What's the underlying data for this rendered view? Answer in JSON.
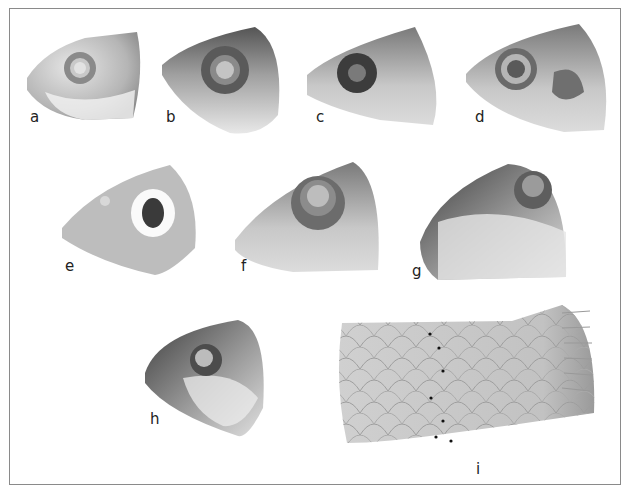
{
  "figure": {
    "panels": [
      {
        "label": "a",
        "subject": "fish head, lateral view"
      },
      {
        "label": "b",
        "subject": "fish head, lateral view"
      },
      {
        "label": "c",
        "subject": "fish head, lateral view"
      },
      {
        "label": "d",
        "subject": "fish head, lateral view"
      },
      {
        "label": "e",
        "subject": "fish head, lateral view"
      },
      {
        "label": "f",
        "subject": "fish head, lateral view"
      },
      {
        "label": "g",
        "subject": "fish head, lateral view"
      },
      {
        "label": "h",
        "subject": "fish head, lateral view"
      },
      {
        "label": "i",
        "subject": "fish body scales with dotted scale row"
      }
    ],
    "colors": {
      "border": "#8a8a8a",
      "label": "#222222"
    }
  }
}
